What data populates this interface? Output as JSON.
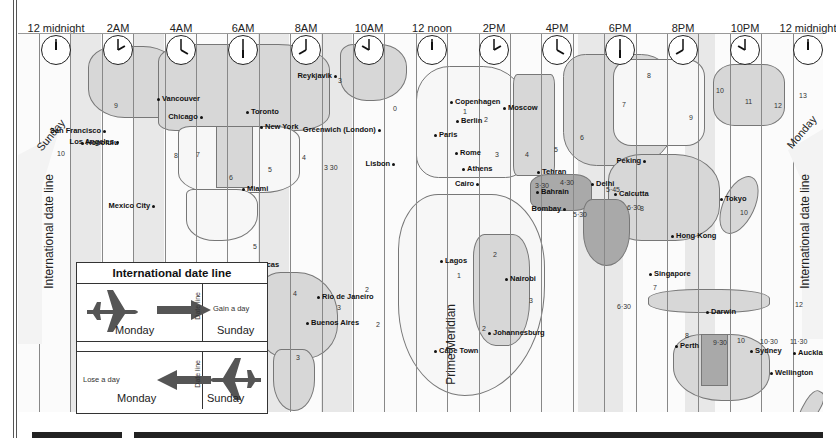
{
  "clocks": [
    {
      "label": "12 midnight",
      "x": 56,
      "hour": 0
    },
    {
      "label": "2AM",
      "x": 118,
      "hour": 2
    },
    {
      "label": "4AM",
      "x": 181,
      "hour": 4
    },
    {
      "label": "6AM",
      "x": 243,
      "hour": 6
    },
    {
      "label": "8AM",
      "x": 306,
      "hour": 8
    },
    {
      "label": "10AM",
      "x": 369,
      "hour": 10
    },
    {
      "label": "12 noon",
      "x": 432,
      "hour": 12
    },
    {
      "label": "2PM",
      "x": 494,
      "hour": 14
    },
    {
      "label": "4PM",
      "x": 557,
      "hour": 16
    },
    {
      "label": "6PM",
      "x": 620,
      "hour": 18
    },
    {
      "label": "8PM",
      "x": 683,
      "hour": 20
    },
    {
      "label": "10PM",
      "x": 745,
      "hour": 22
    },
    {
      "label": "12 midnight",
      "x": 808,
      "hour": 0
    }
  ],
  "labels": {
    "idl_left": "International date line",
    "idl_right": "International date line",
    "sunday": "Sunday",
    "monday": "Monday",
    "prime_meridian": "Prime Meridian"
  },
  "legend": {
    "title": "International date line",
    "gain": "Gain a day",
    "lose": "Lose a day",
    "monday": "Monday",
    "sunday": "Sunday",
    "date": "Date",
    "line": "line"
  },
  "cities": [
    {
      "name": "Vancouver",
      "x": 157,
      "y": 98
    },
    {
      "name": "San Francisco",
      "x": 107,
      "y": 130,
      "r": true
    },
    {
      "name": "Los Angeles",
      "x": 118,
      "y": 141,
      "r": true
    },
    {
      "name": "Chicago",
      "x": 199,
      "y": 116,
      "r": true
    },
    {
      "name": "Toronto",
      "x": 246,
      "y": 111
    },
    {
      "name": "New York",
      "x": 260,
      "y": 126
    },
    {
      "name": "Miami",
      "x": 242,
      "y": 188
    },
    {
      "name": "Mexico City",
      "x": 157,
      "y": 205,
      "r": true
    },
    {
      "name": "Honolulu",
      "x": 81,
      "y": 142
    },
    {
      "name": "Caracas",
      "x": 245,
      "y": 264
    },
    {
      "name": "Rio de Janeiro",
      "x": 317,
      "y": 296
    },
    {
      "name": "Buenos Aires",
      "x": 306,
      "y": 322
    },
    {
      "name": "Reykjavik",
      "x": 337,
      "y": 75,
      "r": true
    },
    {
      "name": "Greenwich (London)",
      "x": 382,
      "y": 129,
      "r": true
    },
    {
      "name": "Lisbon",
      "x": 392,
      "y": 163,
      "r": true
    },
    {
      "name": "Copenhagen",
      "x": 450,
      "y": 101
    },
    {
      "name": "Berlin",
      "x": 456,
      "y": 120
    },
    {
      "name": "Paris",
      "x": 434,
      "y": 134
    },
    {
      "name": "Rome",
      "x": 455,
      "y": 152
    },
    {
      "name": "Athens",
      "x": 462,
      "y": 168
    },
    {
      "name": "Cairo",
      "x": 477,
      "y": 183,
      "r": true
    },
    {
      "name": "Moscow",
      "x": 503,
      "y": 107
    },
    {
      "name": "Lagos",
      "x": 440,
      "y": 260
    },
    {
      "name": "Nairobi",
      "x": 505,
      "y": 278
    },
    {
      "name": "Johannesburg",
      "x": 488,
      "y": 332
    },
    {
      "name": "Cape Town",
      "x": 434,
      "y": 350
    },
    {
      "name": "Tehran",
      "x": 537,
      "y": 171
    },
    {
      "name": "Bahrain",
      "x": 536,
      "y": 191
    },
    {
      "name": "Bombay",
      "x": 558,
      "y": 208,
      "r": true
    },
    {
      "name": "Delhi",
      "x": 591,
      "y": 183
    },
    {
      "name": "Calcutta",
      "x": 614,
      "y": 193
    },
    {
      "name": "Peking",
      "x": 643,
      "y": 160,
      "r": true
    },
    {
      "name": "Tokyo",
      "x": 720,
      "y": 198
    },
    {
      "name": "Hong Kong",
      "x": 671,
      "y": 235
    },
    {
      "name": "Singapore",
      "x": 649,
      "y": 273
    },
    {
      "name": "Darwin",
      "x": 706,
      "y": 311
    },
    {
      "name": "Perth",
      "x": 675,
      "y": 345
    },
    {
      "name": "Sydney",
      "x": 750,
      "y": 350
    },
    {
      "name": "Auckland",
      "x": 793,
      "y": 352
    },
    {
      "name": "Wellington",
      "x": 770,
      "y": 372
    }
  ],
  "offsets": [
    {
      "t": "9",
      "x": 114,
      "y": 101
    },
    {
      "t": "10",
      "x": 57,
      "y": 149
    },
    {
      "t": "8",
      "x": 174,
      "y": 151
    },
    {
      "t": "7",
      "x": 196,
      "y": 150
    },
    {
      "t": "6",
      "x": 229,
      "y": 173
    },
    {
      "t": "5",
      "x": 268,
      "y": 165
    },
    {
      "t": "4",
      "x": 302,
      "y": 153
    },
    {
      "t": "3 30",
      "x": 324,
      "y": 163
    },
    {
      "t": "3",
      "x": 338,
      "y": 76
    },
    {
      "t": "0",
      "x": 393,
      "y": 104
    },
    {
      "t": "1",
      "x": 463,
      "y": 107
    },
    {
      "t": "2",
      "x": 484,
      "y": 115
    },
    {
      "t": "3",
      "x": 495,
      "y": 150
    },
    {
      "t": "4",
      "x": 525,
      "y": 150
    },
    {
      "t": "5",
      "x": 554,
      "y": 145
    },
    {
      "t": "6",
      "x": 580,
      "y": 133
    },
    {
      "t": "7",
      "x": 622,
      "y": 100
    },
    {
      "t": "8",
      "x": 647,
      "y": 71
    },
    {
      "t": "9",
      "x": 689,
      "y": 113
    },
    {
      "t": "10",
      "x": 716,
      "y": 86
    },
    {
      "t": "11",
      "x": 745,
      "y": 97
    },
    {
      "t": "12",
      "x": 774,
      "y": 101
    },
    {
      "t": "13",
      "x": 799,
      "y": 91
    },
    {
      "t": "3·30",
      "x": 535,
      "y": 181
    },
    {
      "t": "4·30",
      "x": 560,
      "y": 178
    },
    {
      "t": "5·45",
      "x": 606,
      "y": 185
    },
    {
      "t": "5·30",
      "x": 573,
      "y": 210
    },
    {
      "t": "6·30",
      "x": 627,
      "y": 203
    },
    {
      "t": "8",
      "x": 640,
      "y": 204
    },
    {
      "t": "10",
      "x": 740,
      "y": 208
    },
    {
      "t": "5",
      "x": 253,
      "y": 242
    },
    {
      "t": "4",
      "x": 293,
      "y": 289
    },
    {
      "t": "3",
      "x": 337,
      "y": 303
    },
    {
      "t": "3",
      "x": 296,
      "y": 353
    },
    {
      "t": "2",
      "x": 365,
      "y": 285
    },
    {
      "t": "2",
      "x": 376,
      "y": 320
    },
    {
      "t": "1",
      "x": 457,
      "y": 271
    },
    {
      "t": "2",
      "x": 493,
      "y": 250
    },
    {
      "t": "2",
      "x": 482,
      "y": 324
    },
    {
      "t": "3",
      "x": 529,
      "y": 296
    },
    {
      "t": "6·30",
      "x": 617,
      "y": 302
    },
    {
      "t": "7",
      "x": 653,
      "y": 283
    },
    {
      "t": "8",
      "x": 685,
      "y": 331
    },
    {
      "t": "9·30",
      "x": 713,
      "y": 338
    },
    {
      "t": "10",
      "x": 737,
      "y": 336
    },
    {
      "t": "10·30",
      "x": 760,
      "y": 337
    },
    {
      "t": "11·30",
      "x": 790,
      "y": 337
    },
    {
      "t": "12",
      "x": 795,
      "y": 300
    }
  ]
}
